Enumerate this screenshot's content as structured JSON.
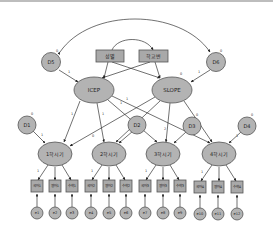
{
  "diagram": {
    "type": "structural-equation-model (latent growth)",
    "covariates": [
      {
        "id": "sex",
        "label": "성별"
      },
      {
        "id": "school",
        "label": "학교변"
      }
    ],
    "growth_factors": [
      {
        "id": "icep",
        "label": "ICEP",
        "variance_label": ""
      },
      {
        "id": "slope",
        "label": "SLOPE",
        "variance_label": "0"
      }
    ],
    "factor_disturbances": [
      {
        "id": "d5",
        "label": "D5",
        "weight": "0",
        "path": "1"
      },
      {
        "id": "d6",
        "label": "D6",
        "weight": "0",
        "path": "1"
      }
    ],
    "time_factors": [
      {
        "id": "t1",
        "label": "1학시기",
        "disturbance": "D1",
        "d_weight": "0",
        "d_path": "1",
        "icep_path": "1",
        "slope_path": "0"
      },
      {
        "id": "t2",
        "label": "2학시기",
        "disturbance": "D2",
        "d_weight": "0",
        "d_path": "1",
        "icep_path": "1",
        "slope_path": "1"
      },
      {
        "id": "t3",
        "label": "3학시기",
        "disturbance": "D3",
        "d_weight": "0",
        "d_path": "1",
        "icep_path": "1",
        "slope_path": "2"
      },
      {
        "id": "t4",
        "label": "4학시기",
        "disturbance": "D4",
        "d_weight": "0",
        "d_path": "1",
        "icep_path": "1",
        "slope_path": "3"
      }
    ],
    "indicators": [
      {
        "label": "국어1",
        "error": "e1"
      },
      {
        "label": "영어1",
        "error": "e2"
      },
      {
        "label": "수학1",
        "error": "e3"
      },
      {
        "label": "국어2",
        "error": "e4"
      },
      {
        "label": "영어2",
        "error": "e5"
      },
      {
        "label": "수학2",
        "error": "e6"
      },
      {
        "label": "국어3",
        "error": "e7"
      },
      {
        "label": "영어3",
        "error": "e8"
      },
      {
        "label": "수학3",
        "error": "e9"
      },
      {
        "label": "국어4",
        "error": "e10"
      },
      {
        "label": "영어4",
        "error": "e11"
      },
      {
        "label": "수학4",
        "error": "e12"
      }
    ],
    "error_weight": "0",
    "error_path": "1",
    "loading_first": "1",
    "colors": {
      "node_fill": "#b3b3b3",
      "box_fill": "#a9a9a9",
      "stroke": "#555555",
      "edge": "#333333"
    }
  }
}
